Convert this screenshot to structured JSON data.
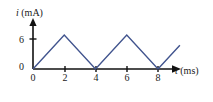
{
  "figure": {
    "background_color": "#ffffff",
    "axis_color": "#111111",
    "curve_color": "#41548e"
  },
  "axes": {
    "y": {
      "label_var": "i",
      "label_unit": "(mA)",
      "ticks": [
        {
          "value": 6,
          "text": "6"
        },
        {
          "value": 0,
          "text": "0"
        }
      ]
    },
    "x": {
      "label_var": "t",
      "label_unit": "(ms)",
      "origin_text": "0",
      "ticks": [
        {
          "value": 2,
          "text": "2"
        },
        {
          "value": 4,
          "text": "4"
        },
        {
          "value": 6,
          "text": "6"
        },
        {
          "value": 8,
          "text": "8"
        }
      ]
    }
  },
  "chart_data": {
    "type": "line",
    "title": "",
    "subtitle": "",
    "xlabel": "t (ms)",
    "ylabel": "i (mA)",
    "xlim": [
      0,
      9.4
    ],
    "ylim": [
      0,
      7.6
    ],
    "grid": false,
    "legend": null,
    "xticks": [
      0,
      2,
      4,
      6,
      8
    ],
    "yticks": [
      0,
      6
    ],
    "series": [
      {
        "name": "i(t)",
        "color": "#41548e",
        "x": [
          0,
          2,
          4,
          6,
          8,
          9.4
        ],
        "y": [
          0,
          6,
          0,
          6,
          0,
          4.2
        ]
      }
    ],
    "annotations": []
  }
}
